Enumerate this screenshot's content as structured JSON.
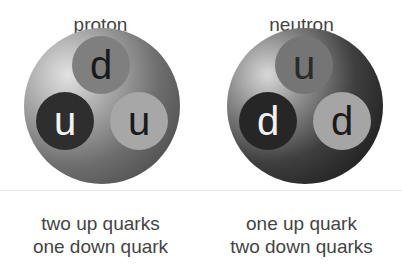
{
  "particles": [
    {
      "name": "proton",
      "quarks": {
        "top": "d",
        "left": "u",
        "right": "u"
      },
      "caption": [
        "two up quarks",
        "one down quark"
      ]
    },
    {
      "name": "neutron",
      "quarks": {
        "top": "u",
        "left": "d",
        "right": "d"
      },
      "caption": [
        "one up quark",
        "two down quarks"
      ]
    }
  ],
  "colors": {
    "text": "#444444",
    "quark_dark": "#2e2e2e",
    "quark_mid": "#7f7f7f",
    "quark_light": "#a7a7a7"
  }
}
